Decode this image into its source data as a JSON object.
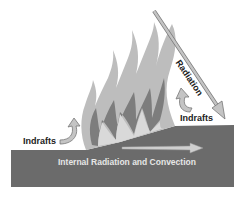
{
  "diagram": {
    "labels": {
      "radiation": "Radiation",
      "indrafts_left": "Indrafts",
      "indrafts_right": "Indrafts",
      "internal": "Internal Radiation and Convection"
    },
    "colors": {
      "ground": "#6b6b6b",
      "flame_outer": "#bdbdbd",
      "flame_inner": "#7d7d7d",
      "flame_core": "#d9d9d9",
      "arrow": "#c4c4c4",
      "arrow_stroke": "#777777"
    }
  }
}
